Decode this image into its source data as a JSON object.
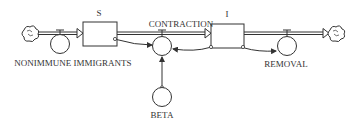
{
  "diagram": {
    "type": "stock-and-flow",
    "colors": {
      "line": "#333333",
      "pipe_fill": "#ffffff",
      "background": "#ffffff"
    },
    "stocks": [
      {
        "id": "S",
        "label": "S"
      },
      {
        "id": "I",
        "label": "I"
      }
    ],
    "flows": [
      {
        "id": "nonimmune_immigrants",
        "label": "NONIMMUNE IMMIGRANTS",
        "from": "cloud-source",
        "to": "S"
      },
      {
        "id": "contraction",
        "label": "CONTRACTION",
        "from": "S",
        "to": "I"
      },
      {
        "id": "removal",
        "label": "REMOVAL",
        "from": "I",
        "to": "cloud-sink"
      }
    ],
    "auxiliaries": [
      {
        "id": "beta",
        "label": "BETA"
      }
    ],
    "links": [
      {
        "from": "S",
        "to": "contraction"
      },
      {
        "from": "I",
        "to": "contraction"
      },
      {
        "from": "beta",
        "to": "contraction"
      },
      {
        "from": "I",
        "to": "removal"
      }
    ],
    "icons": {
      "source": "cloud-icon",
      "sink": "cloud-icon"
    }
  }
}
